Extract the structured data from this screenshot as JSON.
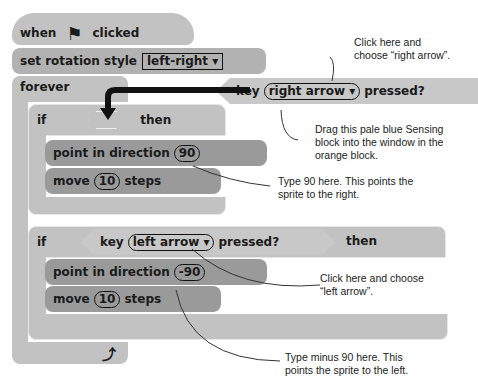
{
  "script": {
    "hat": {
      "when": "when",
      "clicked": "clicked",
      "flag_icon": "green-flag-icon"
    },
    "rotation": {
      "label": "set rotation style",
      "value": "left-right ▾"
    },
    "forever": {
      "label": "forever",
      "loop_icon": "loop-arrow-icon"
    },
    "if1": {
      "if": "if",
      "then": "then"
    },
    "if1_body": [
      {
        "label": "point in direction",
        "value": "90"
      },
      {
        "label_a": "move",
        "value": "10",
        "label_b": "steps"
      }
    ],
    "if2": {
      "if": "if",
      "then": "then",
      "key": "key",
      "option": "left arrow ▾",
      "pressed": "pressed?"
    },
    "if2_body": [
      {
        "label": "point in direction",
        "value": "-90"
      },
      {
        "label_a": "move",
        "value": "10",
        "label_b": "steps"
      }
    ],
    "sensing": {
      "key": "key",
      "option": "right arrow ▾",
      "pressed": "pressed?"
    }
  },
  "annotations": {
    "right_arrow": "Click here and choose “right arrow”.",
    "drag": "Drag this pale blue Sensing block into the window in the orange block.",
    "type90": "Type 90 here. This points the sprite to the right.",
    "left_arrow": "Click here and choose “left arrow”.",
    "minus90": "Type minus 90 here. This points the sprite to the left."
  }
}
